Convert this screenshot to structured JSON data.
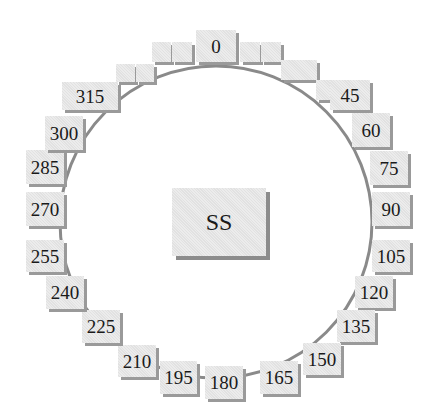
{
  "diagram": {
    "center_label": "SS",
    "ring": {
      "cx": 216,
      "cy": 222,
      "r": 156,
      "stroke": "#8a8a8a"
    },
    "colors": {
      "box_fill": "#e6e6e6",
      "box_shadow": "#9a9a9a",
      "text": "#1a1a1a"
    },
    "labels": [
      {
        "text": "0",
        "x": 196,
        "y": 30,
        "w": 40,
        "h": 32
      },
      {
        "text": "45",
        "x": 330,
        "y": 80,
        "w": 40,
        "h": 30
      },
      {
        "text": "60",
        "x": 352,
        "y": 113,
        "w": 38,
        "h": 34
      },
      {
        "text": "75",
        "x": 370,
        "y": 151,
        "w": 38,
        "h": 34
      },
      {
        "text": "90",
        "x": 372,
        "y": 192,
        "w": 38,
        "h": 34
      },
      {
        "text": "105",
        "x": 372,
        "y": 240,
        "w": 38,
        "h": 32
      },
      {
        "text": "120",
        "x": 355,
        "y": 276,
        "w": 38,
        "h": 32
      },
      {
        "text": "135",
        "x": 337,
        "y": 310,
        "w": 38,
        "h": 32
      },
      {
        "text": "150",
        "x": 303,
        "y": 343,
        "w": 38,
        "h": 32
      },
      {
        "text": "165",
        "x": 260,
        "y": 361,
        "w": 38,
        "h": 33
      },
      {
        "text": "180",
        "x": 205,
        "y": 366,
        "w": 38,
        "h": 33
      },
      {
        "text": "195",
        "x": 160,
        "y": 361,
        "w": 37,
        "h": 33
      },
      {
        "text": "210",
        "x": 118,
        "y": 345,
        "w": 38,
        "h": 32
      },
      {
        "text": "225",
        "x": 82,
        "y": 310,
        "w": 38,
        "h": 33
      },
      {
        "text": "240",
        "x": 46,
        "y": 276,
        "w": 38,
        "h": 33
      },
      {
        "text": "255",
        "x": 26,
        "y": 240,
        "w": 38,
        "h": 32
      },
      {
        "text": "270",
        "x": 26,
        "y": 192,
        "w": 38,
        "h": 34
      },
      {
        "text": "285",
        "x": 26,
        "y": 150,
        "w": 38,
        "h": 34
      },
      {
        "text": "300",
        "x": 45,
        "y": 116,
        "w": 38,
        "h": 34
      },
      {
        "text": "315",
        "x": 62,
        "y": 82,
        "w": 56,
        "h": 28
      }
    ],
    "blank_boxes": [
      {
        "x": 152,
        "y": 42,
        "w": 19,
        "h": 20
      },
      {
        "x": 172,
        "y": 42,
        "w": 20,
        "h": 20
      },
      {
        "x": 240,
        "y": 42,
        "w": 20,
        "h": 20
      },
      {
        "x": 261,
        "y": 42,
        "w": 20,
        "h": 20
      },
      {
        "x": 116,
        "y": 64,
        "w": 19,
        "h": 18
      },
      {
        "x": 136,
        "y": 64,
        "w": 18,
        "h": 18
      },
      {
        "x": 281,
        "y": 60,
        "w": 36,
        "h": 20
      },
      {
        "x": 316,
        "y": 80,
        "w": 14,
        "h": 20
      }
    ],
    "center_box": {
      "x": 172,
      "y": 188,
      "w": 94,
      "h": 68
    }
  }
}
